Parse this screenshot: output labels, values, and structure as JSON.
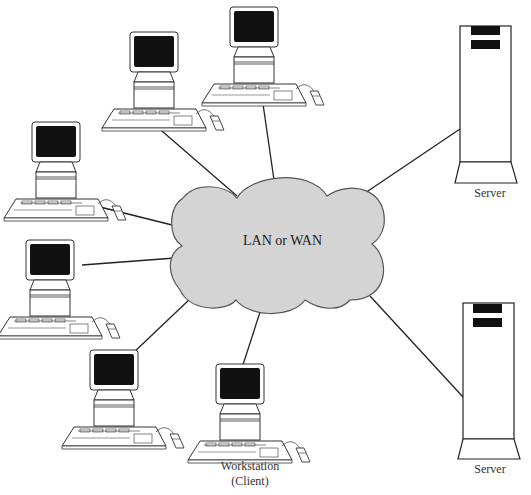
{
  "diagram": {
    "network": {
      "label": "LAN or WAN",
      "fill": "#d4d4d4",
      "stroke": "#555555"
    },
    "nodes": {
      "workstations": [
        {
          "id": "ws-top-left",
          "x": 105,
          "y": 33
        },
        {
          "id": "ws-top-center",
          "x": 205,
          "y": 8
        },
        {
          "id": "ws-left-upper",
          "x": 8,
          "y": 122
        },
        {
          "id": "ws-left-lower",
          "x": 0,
          "y": 238
        },
        {
          "id": "ws-bottom-left",
          "x": 65,
          "y": 350
        },
        {
          "id": "ws-bottom-center",
          "x": 193,
          "y": 362
        }
      ],
      "servers": [
        {
          "id": "server-top",
          "label": "Server"
        },
        {
          "id": "server-bottom",
          "label": "Server"
        }
      ]
    },
    "labels": {
      "workstation_line1": "Workstation",
      "workstation_line2": "(Client)",
      "server_top": "Server",
      "server_bottom": "Server"
    },
    "colors": {
      "line": "#222222",
      "screen": "#111111",
      "outline": "#333333"
    }
  }
}
